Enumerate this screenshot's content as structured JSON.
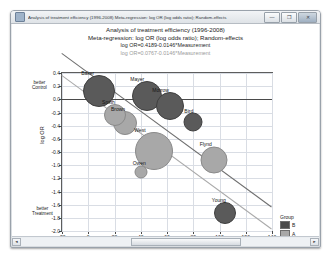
{
  "window": {
    "title": "Analysis of treatment efficiency (1996-2008) Meta-regression: log OR (log odds ratio); Random-effects",
    "app_icon": "chart-icon",
    "buttons": {
      "minimize": "—",
      "maximize": "❐",
      "close": "✕"
    }
  },
  "headings": {
    "line1": "Analysis of treatment efficiency (1996-2008)",
    "line2": "Meta-regression: log OR (log odds ratio); Random-effects",
    "equation1": "log OR=0.4189-0.0146*Measurement",
    "equation2": "log OR=0.0767-0.0146*Measurement"
  },
  "axis_notes": {
    "top": "better\nControl",
    "top_l1": "better",
    "top_l2": "Control",
    "bottom_l1": "better",
    "bottom_l2": "Treatment"
  },
  "legend": {
    "title": "Group",
    "entries": [
      {
        "label": "B",
        "color": "#4a4a4a"
      },
      {
        "label": "A",
        "color": "#a8a8a8"
      }
    ]
  },
  "scrollbar": {
    "left_arrow": "◄",
    "right_arrow": "►"
  },
  "chart_data": {
    "type": "scatter",
    "title": "Analysis of treatment efficiency (1996-2008)",
    "subtitle": "Meta-regression: log OR (log odds ratio); Random-effects",
    "xlabel": "Measurement",
    "ylabel": "log OR",
    "xlim": [
      -20,
      140
    ],
    "ylim": [
      -2.0,
      0.4
    ],
    "xticks": [
      -20,
      0,
      20,
      40,
      60,
      80,
      100,
      120,
      140
    ],
    "yticks": [
      0.4,
      0.2,
      0.0,
      -0.2,
      -0.4,
      -0.6,
      -0.8,
      -1.0,
      -1.2,
      -1.4,
      -1.6,
      -1.8,
      -2.0
    ],
    "grid": true,
    "legend_position": "right-bottom",
    "zero_line": 0.0,
    "regression_lines": [
      {
        "name": "log OR=0.4189-0.0146*Measurement",
        "intercept": 0.4189,
        "slope": -0.0146,
        "color": "#6e6e6e"
      },
      {
        "name": "log OR=0.0767-0.0146*Measurement",
        "intercept": 0.0767,
        "slope": -0.0146,
        "color": "#a9a9a9"
      }
    ],
    "points": [
      {
        "label": "Baker",
        "x": 8,
        "y": 0.13,
        "size": 30,
        "group": "B"
      },
      {
        "label": "Mayer",
        "x": 45,
        "y": 0.05,
        "size": 28,
        "group": "B"
      },
      {
        "label": "Morrow",
        "x": 62,
        "y": -0.1,
        "size": 26,
        "group": "B"
      },
      {
        "label": "Smith",
        "x": 20,
        "y": -0.24,
        "size": 20,
        "group": "A"
      },
      {
        "label": "Brown",
        "x": 28,
        "y": -0.36,
        "size": 22,
        "group": "A"
      },
      {
        "label": "Bird",
        "x": 80,
        "y": -0.35,
        "size": 17,
        "group": "B"
      },
      {
        "label": "West",
        "x": 50,
        "y": -0.78,
        "size": 36,
        "group": "A"
      },
      {
        "label": "Owen",
        "x": 40,
        "y": -1.1,
        "size": 11,
        "group": "A"
      },
      {
        "label": "Flynd",
        "x": 96,
        "y": -0.92,
        "size": 25,
        "group": "A"
      },
      {
        "label": "Young",
        "x": 104,
        "y": -1.72,
        "size": 20,
        "group": "B"
      }
    ]
  }
}
